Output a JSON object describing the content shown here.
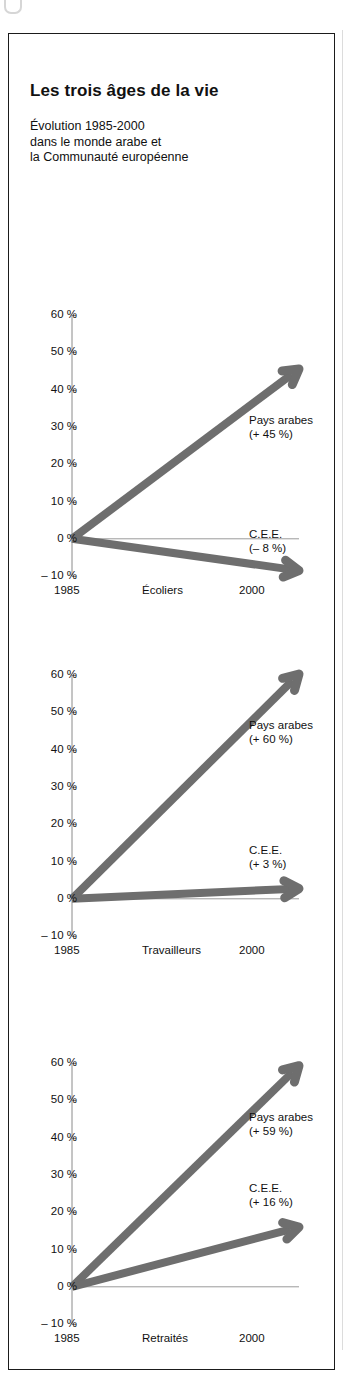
{
  "figure": {
    "title": "Les trois âges de la vie",
    "subtitle_lines": [
      "Évolution 1985-2000",
      "dans le monde arabe et",
      "la Communauté européenne"
    ],
    "arrow_color": "#6e6e6e",
    "axis_color": "#8a8a8a",
    "frame_color": "#1b1b1b"
  },
  "chart_data": [
    {
      "type": "line",
      "title": "Écoliers",
      "xlabel": "Écoliers",
      "ylabel": "",
      "x": [
        "1985",
        "2000"
      ],
      "xticklabels": [
        "1985",
        "2000"
      ],
      "yticklabels": [
        "60 %",
        "50 %",
        "40 %",
        "30 %",
        "20 %",
        "10 %",
        "0 %",
        "– 10 %"
      ],
      "ytickvalues": [
        60,
        50,
        40,
        30,
        20,
        10,
        0,
        -10
      ],
      "ylim": [
        -10,
        60
      ],
      "grid": false,
      "legend": "annotations",
      "series": [
        {
          "name": "Pays arabes",
          "label": "Pays arabes",
          "value_label": "(+ 45 %)",
          "values": [
            0,
            45
          ]
        },
        {
          "name": "C.E.E.",
          "label": "C.E.E.",
          "value_label": "(– 8 %)",
          "values": [
            0,
            -8
          ]
        }
      ]
    },
    {
      "type": "line",
      "title": "Travailleurs",
      "xlabel": "Travailleurs",
      "ylabel": "",
      "x": [
        "1985",
        "2000"
      ],
      "xticklabels": [
        "1985",
        "2000"
      ],
      "yticklabels": [
        "60 %",
        "50 %",
        "40 %",
        "30 %",
        "20 %",
        "10 %",
        "0 %",
        "– 10 %"
      ],
      "ytickvalues": [
        60,
        50,
        40,
        30,
        20,
        10,
        0,
        -10
      ],
      "ylim": [
        -10,
        60
      ],
      "grid": false,
      "legend": "annotations",
      "series": [
        {
          "name": "Pays arabes",
          "label": "Pays arabes",
          "value_label": "(+ 60 %)",
          "values": [
            0,
            60
          ]
        },
        {
          "name": "C.E.E.",
          "label": "C.E.E.",
          "value_label": "(+ 3 %)",
          "values": [
            0,
            3
          ]
        }
      ]
    },
    {
      "type": "line",
      "title": "Retraités",
      "xlabel": "Retraités",
      "ylabel": "",
      "x": [
        "1985",
        "2000"
      ],
      "xticklabels": [
        "1985",
        "2000"
      ],
      "yticklabels": [
        "60 %",
        "50 %",
        "40 %",
        "30 %",
        "20 %",
        "10 %",
        "0 %",
        "– 10 %"
      ],
      "ytickvalues": [
        60,
        50,
        40,
        30,
        20,
        10,
        0,
        -10
      ],
      "ylim": [
        -10,
        60
      ],
      "grid": false,
      "legend": "annotations",
      "series": [
        {
          "name": "Pays arabes",
          "label": "Pays arabes",
          "value_label": "(+ 59 %)",
          "values": [
            0,
            59
          ]
        },
        {
          "name": "C.E.E.",
          "label": "C.E.E.",
          "value_label": "(+ 16 %)",
          "values": [
            0,
            16
          ]
        }
      ]
    }
  ]
}
